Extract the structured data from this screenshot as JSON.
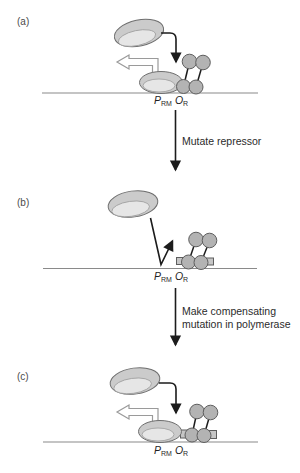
{
  "figure": {
    "panels": [
      {
        "label": "(a)"
      },
      {
        "label": "(b)"
      },
      {
        "label": "(c)"
      }
    ],
    "site_label": {
      "p": "P",
      "p_sub": "RM",
      "o": "O",
      "o_sub": "R"
    },
    "steps": [
      {
        "line1": "Mutate repressor",
        "line2": ""
      },
      {
        "line1": "Make compensating",
        "line2": "mutation in polymerase"
      }
    ],
    "shapes": {
      "polymerase": "rna-polymerase-blob",
      "repressor": "repressor-dimer-circles",
      "dna": "horizontal-dna-line",
      "recruitment_arrow": "curved-black-arrow",
      "transcription_arrow": "open-outline-left-arrow",
      "failed_binding_arrow": "v-shaped-bounce-arrow",
      "mutation_marker": "small-gray-square"
    },
    "colors": {
      "background": "#ffffff",
      "dna_line": "#8a8a8a",
      "arrow": "#1c1c1c",
      "open_arrow_outline": "#9a9a9a",
      "polymerase_fill": "#cbcbcb",
      "polymerase_face": "#e6e6e6",
      "repressor_fill": "#b3b3b3",
      "shape_outline": "#5e5e5e",
      "text": "#2b2b2b"
    }
  }
}
